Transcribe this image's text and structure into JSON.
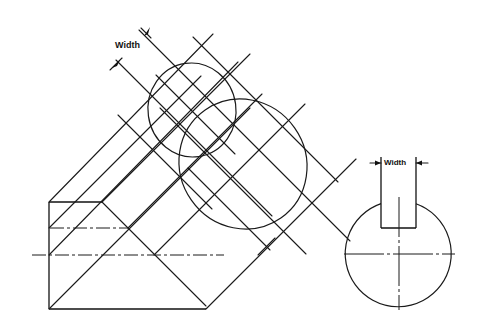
{
  "figure": {
    "colors": {
      "line": "#1a1a1a",
      "background": "#ffffff"
    }
  },
  "labels": {
    "width_oblique": "Width",
    "width_end_view": "Width"
  },
  "side_view": {
    "rectangle": {
      "left": 49,
      "top": 202,
      "bottom": 309,
      "top_right": 102,
      "bottom_right": 206
    },
    "hidden_line_y": 228,
    "centerline_y": 255
  },
  "ellipses": [
    {
      "name": "small-ellipse",
      "cx": 192,
      "cy": 110,
      "rx": 44,
      "ry": 47
    },
    {
      "name": "large-ellipse",
      "cx": 243,
      "cy": 164,
      "rx": 63,
      "ry": 66
    }
  ],
  "end_view": {
    "circle": {
      "cx": 399,
      "cy": 254,
      "r": 53
    },
    "keyslot": {
      "left": 381,
      "right": 416,
      "top": 157,
      "bottom": 228
    }
  }
}
